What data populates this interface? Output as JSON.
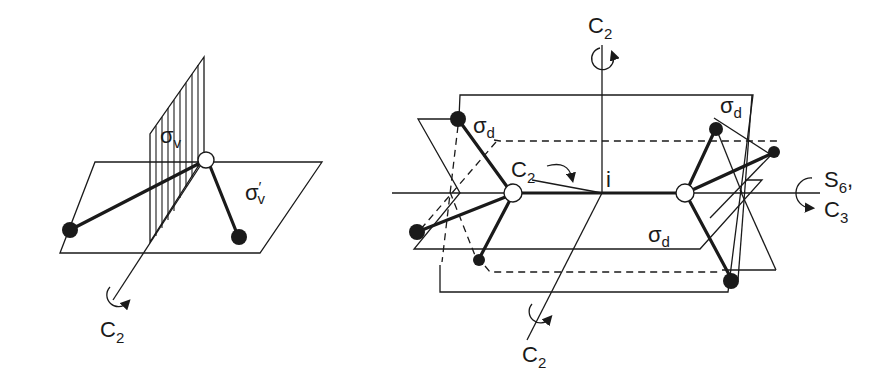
{
  "figure": {
    "left_panel": {
      "description": "Bent triatomic molecule (C2v) with symmetry elements",
      "labels": {
        "sigma_v": {
          "main": "σ",
          "sub": "v"
        },
        "sigma_v_prime": {
          "main": "σ",
          "sub": "v",
          "prime": "′"
        },
        "c2_axis": {
          "main": "C",
          "sub": "2"
        }
      }
    },
    "right_panel": {
      "description": "Staggered ethane-like molecule (D3d) with symmetry elements",
      "labels": {
        "c2_top": {
          "main": "C",
          "sub": "2"
        },
        "c2_inner": {
          "main": "C",
          "sub": "2"
        },
        "c2_bottom": {
          "main": "C",
          "sub": "2"
        },
        "sigma_d_left": {
          "main": "σ",
          "sub": "d"
        },
        "sigma_d_right": {
          "main": "σ",
          "sub": "d"
        },
        "sigma_d_bottom": {
          "main": "σ",
          "sub": "d"
        },
        "inversion_center": "i",
        "s6_axis": {
          "main": "S",
          "sub": "6",
          "suffix": ","
        },
        "c3_axis": {
          "main": "C",
          "sub": "3"
        }
      }
    }
  }
}
